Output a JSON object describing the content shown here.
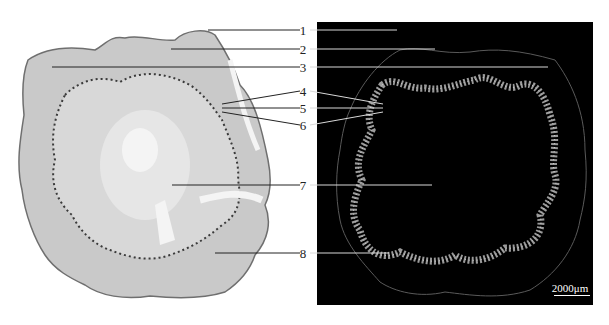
{
  "figure": {
    "left_panel": {
      "description": "brightfield stained transverse section"
    },
    "right_panel": {
      "description": "fluorescence transverse section",
      "background": "#000000"
    },
    "labels": [
      {
        "num": "1",
        "y": 30
      },
      {
        "num": "2",
        "y": 49
      },
      {
        "num": "3",
        "y": 67
      },
      {
        "num": "4",
        "y": 91
      },
      {
        "num": "5",
        "y": 108
      },
      {
        "num": "6",
        "y": 125
      },
      {
        "num": "7",
        "y": 186
      },
      {
        "num": "8",
        "y": 253
      }
    ],
    "scale_bar": {
      "text": "2000μm"
    }
  }
}
